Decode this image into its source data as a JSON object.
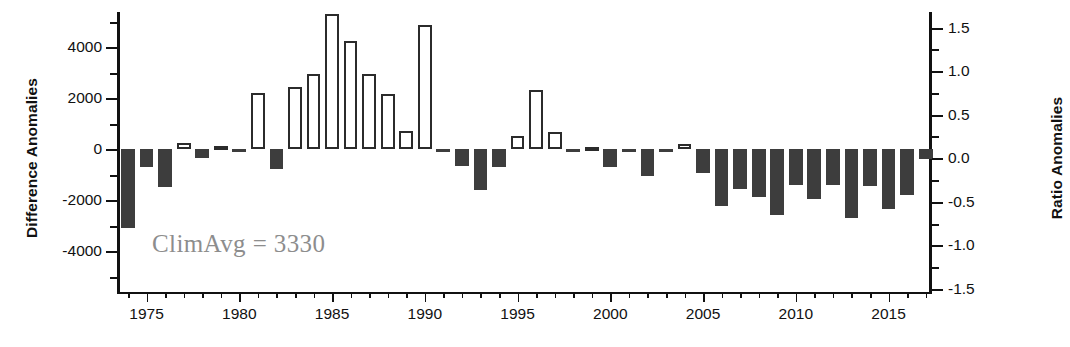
{
  "chart_data": {
    "type": "bar",
    "title": "",
    "xlabel": "",
    "ylabel": "Difference Anomalies",
    "ylabel_secondary": "Ratio Anomalies",
    "ylim": [
      -5200,
      5600
    ],
    "ylim_secondary": [
      -1.56,
      1.68
    ],
    "xlim": [
      1973.4,
      1917.6
    ],
    "grid": false,
    "legend": null,
    "annotations": [
      {
        "text": "ClimAvg = 3330",
        "x": 1976.5,
        "y": -3200
      }
    ],
    "y_ticks": [
      -4000,
      -2000,
      0,
      2000,
      4000
    ],
    "y_tick_labels": [
      "-4000",
      "-2000",
      "0",
      "2000",
      "4000"
    ],
    "y_minor_ticks": [
      -5000,
      -3000,
      -1000,
      1000,
      3000,
      5000
    ],
    "y_ticks_secondary": [
      -1.5,
      -1.0,
      -0.5,
      0.0,
      0.5,
      1.0,
      1.5
    ],
    "y_tick_labels_secondary": [
      "-1.5",
      "-1.0",
      "-0.5",
      "0.0",
      "0.5",
      "1.0",
      "1.5"
    ],
    "x_ticks": [
      1975,
      1980,
      1985,
      1990,
      1995,
      2000,
      2005,
      2010,
      2015
    ],
    "x_tick_labels": [
      "1975",
      "1980",
      "1985",
      "1990",
      "1995",
      "2000",
      "2005",
      "2010",
      "2015"
    ],
    "x_minor_range": [
      1974,
      2017
    ],
    "categories": [
      1974,
      1975,
      1976,
      1977,
      1978,
      1979,
      1980,
      1981,
      1982,
      1983,
      1984,
      1985,
      1986,
      1987,
      1988,
      1989,
      1990,
      1991,
      1992,
      1993,
      1994,
      1995,
      1996,
      1997,
      1998,
      1999,
      2000,
      2001,
      2002,
      2003,
      2004,
      2005,
      2006,
      2007,
      2008,
      2009,
      2010,
      2011,
      2012,
      2013,
      2014,
      2015,
      2016,
      2017
    ],
    "values": [
      -3100,
      -700,
      -1500,
      230,
      -350,
      120,
      -80,
      2200,
      -800,
      2450,
      2950,
      5300,
      4250,
      2950,
      2150,
      700,
      4850,
      -100,
      -650,
      -1600,
      -700,
      500,
      2300,
      650,
      -100,
      80,
      -700,
      -100,
      -1050,
      -90,
      200,
      -950,
      -2250,
      -1550,
      -1900,
      -2600,
      -1400,
      -1950,
      -1400,
      -2700,
      -1450,
      -2350,
      -1800,
      -400
    ],
    "values_secondary_note": "Ratio axis: 1000 difference units ≈ 0.30 ratio units (ClimAvg = 3330)",
    "bar_style": {
      "positive_fill": "#ffffff",
      "positive_edge": "#2b2b2b",
      "negative_fill": "#3d3d3d",
      "width_fraction": 0.74
    }
  },
  "axes": {
    "left_title": "Difference Anomalies",
    "right_title": "Ratio Anomalies"
  },
  "annotation": {
    "climavg_text": "ClimAvg = 3330",
    "climavg_color": "#8d8d8d"
  },
  "caption": {
    "fragment": ""
  }
}
